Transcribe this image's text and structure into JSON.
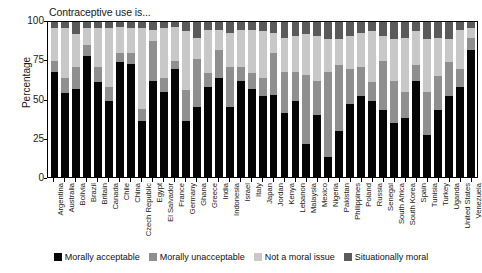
{
  "chart_data": {
    "type": "bar",
    "subtype": "stacked-100-percent",
    "title": "Contraceptive use is...",
    "xlabel": "",
    "ylabel": "Percentage",
    "ylim": [
      0,
      100
    ],
    "yticks": [
      0,
      25,
      50,
      75,
      100
    ],
    "grid": false,
    "legend_position": "bottom",
    "stack_order_bottom_to_top": [
      "Morally acceptable",
      "Morally unacceptable",
      "Not a moral issue",
      "Situationally moral"
    ],
    "colors": {
      "Morally acceptable": "#050505",
      "Morally unacceptable": "#8f8f8f",
      "Not a moral issue": "#c8c8c8",
      "Situationally moral": "#5a5a5a"
    },
    "categories": [
      "Argentina",
      "Australia",
      "Bolivia",
      "Brazil",
      "Britain",
      "Canada",
      "Chile",
      "China",
      "Czech Republic",
      "Egypt",
      "El Salvador",
      "France",
      "Germany",
      "Ghana",
      "Greece",
      "India",
      "Indonesia",
      "Israel",
      "Italy",
      "Japan",
      "Jordan",
      "Kenya",
      "Lebanon",
      "Malaysia",
      "Mexico",
      "Nigeria",
      "Pakistan",
      "Philippines",
      "Poland",
      "Russia",
      "Senegal",
      "South Africa",
      "South Korea",
      "Spain",
      "Tunisia",
      "Turkey",
      "Uganda",
      "United States",
      "Venezuela"
    ],
    "series": [
      {
        "name": "Morally acceptable",
        "values": [
          68,
          54,
          57,
          78,
          61,
          49,
          74,
          73,
          36,
          62,
          55,
          70,
          36,
          45,
          58,
          64,
          45,
          62,
          57,
          52,
          53,
          41,
          49,
          21,
          40,
          13,
          30,
          47,
          52,
          49,
          43,
          35,
          38,
          62,
          27,
          43,
          52,
          58,
          82
        ]
      },
      {
        "name": "Morally unacceptable",
        "values": [
          7,
          10,
          14,
          7,
          10,
          9,
          6,
          7,
          8,
          26,
          9,
          5,
          20,
          31,
          9,
          18,
          26,
          9,
          10,
          12,
          27,
          27,
          19,
          45,
          22,
          55,
          42,
          23,
          19,
          12,
          32,
          27,
          17,
          10,
          28,
          22,
          22,
          12,
          8
        ]
      },
      {
        "name": "Not a moral issue",
        "values": [
          21,
          32,
          21,
          11,
          25,
          38,
          17,
          16,
          52,
          7,
          32,
          22,
          38,
          14,
          28,
          13,
          22,
          24,
          28,
          30,
          13,
          22,
          23,
          26,
          29,
          21,
          17,
          21,
          22,
          33,
          16,
          27,
          35,
          22,
          34,
          25,
          15,
          25,
          6
        ]
      },
      {
        "name": "Situationally moral",
        "values": [
          4,
          4,
          8,
          4,
          4,
          4,
          3,
          4,
          4,
          5,
          4,
          3,
          6,
          10,
          5,
          5,
          7,
          5,
          5,
          6,
          7,
          10,
          9,
          8,
          9,
          11,
          11,
          9,
          7,
          6,
          9,
          11,
          10,
          6,
          11,
          10,
          11,
          5,
          4
        ]
      }
    ]
  },
  "axis": {
    "ylabel": "Percentage",
    "ytick_labels": [
      "100",
      "75",
      "50",
      "25",
      "0"
    ]
  },
  "legend": {
    "items": [
      {
        "label": "Morally acceptable",
        "color": "#050505"
      },
      {
        "label": "Morally unacceptable",
        "color": "#8f8f8f"
      },
      {
        "label": "Not a moral issue",
        "color": "#c8c8c8"
      },
      {
        "label": "Situationally moral",
        "color": "#5a5a5a"
      }
    ]
  }
}
